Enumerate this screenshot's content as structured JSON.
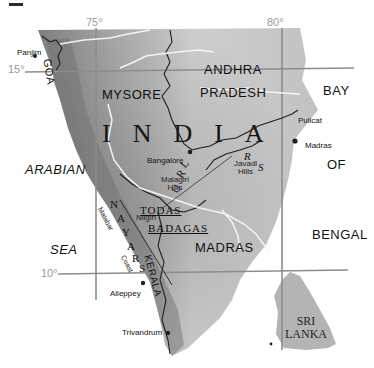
{
  "map": {
    "type": "regional-relief-map",
    "region": "South India",
    "colors": {
      "land_light": "#d0d0d0",
      "land_dark": "#8a8a8a",
      "sea": "#ffffff",
      "grid_line": "#8c8c8c",
      "border": "#1e1e1e",
      "river": "#f4f4f4"
    },
    "grid": {
      "longitudes": [
        {
          "label": "75°",
          "value": 75
        },
        {
          "label": "80°",
          "value": 80
        }
      ],
      "latitudes": [
        {
          "label": "15°",
          "value": 15
        },
        {
          "label": "10°",
          "value": 10
        }
      ]
    },
    "country_label": "INDIA",
    "country_letters": [
      "I",
      "N",
      "D",
      "I",
      "A"
    ],
    "seas": {
      "arabian": "ARABIAN",
      "arabian_sea": "SEA",
      "bay": "BAY",
      "bay_of": "OF",
      "bengal": "BENGAL"
    },
    "states": {
      "goa": "GOA",
      "mysore": "MYSORE",
      "andhra": "ANDHRA",
      "pradesh": "PRADESH",
      "madras": "MADRAS",
      "kerala": "KERALA",
      "sri": "SRI",
      "lanka": "LANKA"
    },
    "cities": {
      "panjim": "Panjim",
      "bangalore": "Bangalore",
      "pulicat": "Pulicat",
      "madras": "Madras",
      "alleppey": "Alleppey",
      "trivandrum": "Trivandrum"
    },
    "features": {
      "malabar": "Malabar",
      "coast": "Coast",
      "malagiri": "Malagiri",
      "malagiri_hills": "Hills",
      "javadi": "Javadi",
      "javadi_hills": "Hills",
      "nilgiri": "Nilgiri"
    },
    "peoples": {
      "nayars": [
        "N",
        "A",
        "Y",
        "A",
        "R",
        "S"
      ],
      "kurumbas": [
        "K",
        "U",
        "R",
        "U",
        "M",
        "B",
        "A",
        "S"
      ],
      "irulas_letters": [
        "R",
        "U",
        "L",
        "A",
        "R",
        "S"
      ],
      "todas": "TODAS",
      "badagas": "BADAGAS"
    }
  }
}
